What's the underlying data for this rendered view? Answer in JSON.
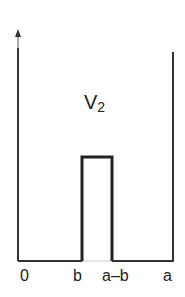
{
  "diagram": {
    "title_main": "V",
    "title_sub": "2",
    "x_labels": [
      "0",
      "b",
      "a–b",
      "a"
    ],
    "colors": {
      "line": "#333333",
      "barrier": "#222222",
      "gap_floor": "#cccccc"
    }
  }
}
